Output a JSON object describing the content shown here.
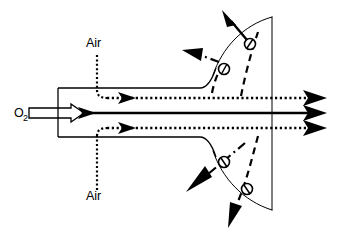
{
  "figure": {
    "background_color": "#ffffff",
    "line_color": "#000000",
    "width": 337,
    "height": 236
  },
  "labels": {
    "oxygen": {
      "text": "O",
      "subscript": "2",
      "x": 14,
      "y": 117
    },
    "air_top": {
      "text": "Air",
      "x": 86,
      "y": 47
    },
    "air_bottom": {
      "text": "Air",
      "x": 86,
      "y": 200
    }
  },
  "flows": {
    "oxygen_jet": {
      "name": "O2 central jet",
      "style": "solid",
      "axis_y": 113,
      "start_x": 100,
      "end_x": 325
    },
    "air_upper": {
      "name": "Upper air stream",
      "style": "dotted",
      "axis_y": 98,
      "start_x": 100,
      "end_x": 325
    },
    "air_lower": {
      "name": "Lower air stream",
      "style": "dotted",
      "axis_y": 128,
      "start_x": 100,
      "end_x": 325
    }
  },
  "markers": {
    "count": 4,
    "shape": "circle-with-slash",
    "radius": 5.5,
    "positions": [
      {
        "id": "marker-upper-outer",
        "x": 250,
        "y": 44
      },
      {
        "id": "marker-upper-inner",
        "x": 224,
        "y": 69
      },
      {
        "id": "marker-lower-inner",
        "x": 224,
        "y": 162
      },
      {
        "id": "marker-lower-outer",
        "x": 247,
        "y": 189
      }
    ]
  },
  "flame_envelope": {
    "name": "flame boundary",
    "right_edge_x": 272,
    "top_y": 17,
    "bottom_y": 210
  },
  "arrows": {
    "exit_count": 3,
    "entrainment_count": 4,
    "inlet_style": "hollow-block-arrow"
  }
}
